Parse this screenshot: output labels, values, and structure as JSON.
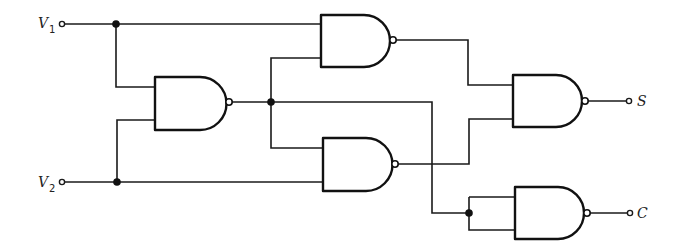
{
  "diagram": {
    "title": "",
    "type": "logic-circuit",
    "colors": {
      "line": "#1a1a1a",
      "background": "#ffffff"
    },
    "inputs": [
      {
        "id": "V1",
        "label": "V",
        "subscript": "1"
      },
      {
        "id": "V2",
        "label": "V",
        "subscript": "2"
      }
    ],
    "outputs": [
      {
        "id": "S",
        "label": "S"
      },
      {
        "id": "C",
        "label": "C"
      }
    ],
    "gates": [
      {
        "id": "G1",
        "type": "NAND",
        "inputs": [
          "V1",
          "V2"
        ]
      },
      {
        "id": "G2",
        "type": "NAND",
        "inputs": [
          "V1",
          "G1"
        ]
      },
      {
        "id": "G3",
        "type": "NAND",
        "inputs": [
          "G1",
          "V2"
        ]
      },
      {
        "id": "G4",
        "type": "NAND",
        "inputs": [
          "G2",
          "G3"
        ],
        "output": "S"
      },
      {
        "id": "G5",
        "type": "NAND",
        "inputs": [
          "G1",
          "G1"
        ],
        "output": "C"
      }
    ]
  }
}
